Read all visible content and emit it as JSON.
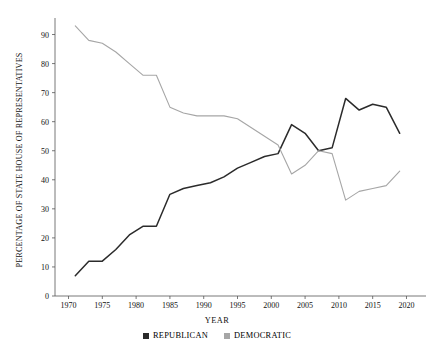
{
  "chart_data": {
    "type": "line",
    "title": "",
    "subtitle": "",
    "xlabel": "YEAR",
    "ylabel": "PERCENTAGE OF STATE HOUSE OF REPRESENTATIVES",
    "xlim": [
      1968,
      2022
    ],
    "ylim": [
      0,
      95
    ],
    "grid": false,
    "legend_position": "bottom-center",
    "xticks": [
      1970,
      1975,
      1980,
      1985,
      1990,
      1995,
      2000,
      2005,
      2010,
      2015,
      2020
    ],
    "xtick_labels": [
      "1970",
      "1975",
      "1980",
      "1985",
      "1990",
      "1995",
      "2000",
      "2005",
      "2010",
      "2015",
      "2020"
    ],
    "yticks": [
      0,
      10,
      20,
      30,
      40,
      50,
      60,
      70,
      80,
      90
    ],
    "ytick_labels": [
      "0",
      "10",
      "20",
      "30",
      "40",
      "50",
      "60",
      "70",
      "80",
      "90"
    ],
    "series": [
      {
        "name": "REPUBLICAN",
        "color": "#2b2b2b",
        "x": [
          1971,
          1973,
          1975,
          1977,
          1979,
          1981,
          1983,
          1985,
          1987,
          1989,
          1991,
          1993,
          1995,
          1997,
          1999,
          2001,
          2003,
          2005,
          2007,
          2009,
          2011,
          2013,
          2015,
          2017,
          2019
        ],
        "values": [
          7,
          12,
          12,
          16,
          21,
          24,
          24,
          35,
          37,
          38,
          39,
          41,
          44,
          46,
          48,
          49,
          59,
          56,
          50,
          51,
          68,
          64,
          66,
          65,
          56
        ]
      },
      {
        "name": "DEMOCRATIC",
        "color": "#a6a6a6",
        "x": [
          1971,
          1973,
          1975,
          1977,
          1979,
          1981,
          1983,
          1985,
          1987,
          1989,
          1991,
          1993,
          1995,
          1997,
          1999,
          2001,
          2003,
          2005,
          2007,
          2009,
          2011,
          2013,
          2015,
          2017,
          2019
        ],
        "values": [
          93,
          88,
          87,
          84,
          80,
          76,
          76,
          65,
          63,
          62,
          62,
          62,
          61,
          58,
          55,
          52,
          42,
          45,
          50,
          49,
          33,
          36,
          37,
          38,
          43
        ]
      }
    ]
  },
  "legend": {
    "entries": [
      {
        "label": "REPUBLICAN",
        "color": "#2b2b2b"
      },
      {
        "label": "DEMOCRATIC",
        "color": "#a6a6a6"
      }
    ]
  },
  "axes": {
    "x_title": "YEAR",
    "y_title": "PERCENTAGE OF STATE HOUSE OF REPRESENTATIVES"
  }
}
